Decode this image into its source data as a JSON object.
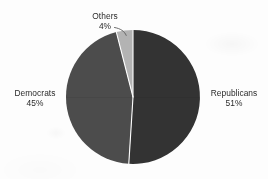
{
  "chart_data": {
    "type": "pie",
    "title": "",
    "subtitle": "",
    "xlabel": "",
    "ylabel": "",
    "legend_position": "none",
    "grid": false,
    "labels_inline": true,
    "start_angle_deg": 0,
    "direction": "clockwise",
    "categories": [
      "Republicans",
      "Democrats",
      "Others"
    ],
    "values": [
      51,
      45,
      4
    ],
    "value_unit": "%",
    "slices": [
      {
        "name": "Republicans",
        "label": "Republicans",
        "value": 51,
        "value_text": "51%",
        "color": "#333333",
        "label_position": "right"
      },
      {
        "name": "Democrats",
        "label": "Democrats",
        "value": 45,
        "value_text": "45%",
        "color": "#4c4c4c",
        "label_position": "left"
      },
      {
        "name": "Others",
        "label": "Others",
        "value": 4,
        "value_text": "4%",
        "color": "#b3b3b3",
        "label_position": "top",
        "has_leader_line": true
      }
    ]
  },
  "labels": {
    "others": {
      "name": "Others",
      "percent": "4%"
    },
    "democrats": {
      "name": "Democrats",
      "percent": "45%"
    },
    "republicans": {
      "name": "Republicans",
      "percent": "51%"
    }
  },
  "colors": {
    "background": "#fdfdfd",
    "republicans": "#333333",
    "democrats": "#4c4c4c",
    "others": "#b3b3b3",
    "slice_divider": "#fdfdfd",
    "text": "#2b2b2b",
    "leader_line": "#5a5a5a"
  },
  "geometry": {
    "center_x": 133,
    "center_y": 97,
    "radius": 67
  }
}
